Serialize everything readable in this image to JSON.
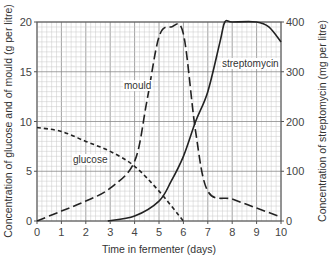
{
  "chart_data": {
    "type": "line",
    "title": "",
    "xlabel": "Time in fermenter (days)",
    "ylabel": "Concentration of glucose and of mould (g per litre)",
    "y2label": "Concentration of streptomycin (mg per litre)",
    "xlim": [
      0,
      10
    ],
    "ylim": [
      0,
      20
    ],
    "y2lim": [
      0,
      400
    ],
    "x_ticks": [
      "0",
      "1",
      "2",
      "3",
      "4",
      "5",
      "6",
      "7",
      "8",
      "9",
      "10"
    ],
    "y_ticks": [
      "0",
      "5",
      "10",
      "15",
      "20"
    ],
    "y2_ticks": [
      "0",
      "100",
      "200",
      "300",
      "400"
    ],
    "grid": true,
    "series": [
      {
        "name": "glucose",
        "axis": "left",
        "style": "short-dashed",
        "x": [
          0,
          1,
          2,
          3,
          4,
          5,
          6
        ],
        "values": [
          9.4,
          9.0,
          8.0,
          7.0,
          5.5,
          3.0,
          0
        ]
      },
      {
        "name": "mould",
        "axis": "left",
        "style": "long-dashed",
        "x": [
          0,
          1,
          2,
          3,
          4,
          4.5,
          5,
          5.5,
          6,
          6.5,
          7,
          8,
          9,
          10
        ],
        "values": [
          0,
          1.0,
          2.0,
          3.3,
          6.0,
          12.0,
          18.5,
          19.5,
          18.8,
          9.0,
          3.0,
          2.2,
          1.3,
          0.4
        ]
      },
      {
        "name": "streptomycin",
        "axis": "right",
        "style": "solid",
        "x": [
          2.9,
          4,
          5,
          5.5,
          6,
          6.5,
          7,
          7.5,
          7.7,
          8,
          9,
          9.5,
          10
        ],
        "values": [
          0,
          10,
          40,
          80,
          130,
          200,
          260,
          360,
          400,
          400,
          400,
          390,
          360
        ]
      }
    ],
    "annotations": [
      "glucose",
      "mould",
      "streptomycin"
    ]
  }
}
